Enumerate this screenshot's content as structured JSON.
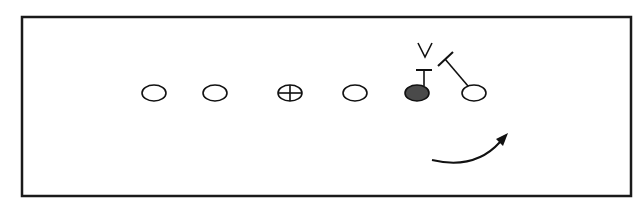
{
  "diagram": {
    "type": "football-play-diagram",
    "frame": {
      "x": 22,
      "y": 17,
      "width": 609,
      "height": 179,
      "stroke": "#1a1a1a"
    },
    "players": [
      {
        "id": "lineman-1",
        "shape": "open-ellipse",
        "cx": 154,
        "cy": 93
      },
      {
        "id": "lineman-2",
        "shape": "open-ellipse",
        "cx": 215,
        "cy": 93
      },
      {
        "id": "center",
        "shape": "crossed-ellipse",
        "cx": 290,
        "cy": 93
      },
      {
        "id": "lineman-4",
        "shape": "open-ellipse",
        "cx": 355,
        "cy": 93
      },
      {
        "id": "highlighted-player",
        "shape": "filled-ellipse",
        "cx": 417,
        "cy": 93,
        "fill": "#4a4a4a"
      },
      {
        "id": "end",
        "shape": "open-ellipse",
        "cx": 474,
        "cy": 93
      }
    ],
    "defender_mark": {
      "symbol": "V",
      "x": 425,
      "y": 52
    },
    "blocks": [
      {
        "from": "highlighted-player",
        "type": "vertical-block",
        "x": 424,
        "y1": 88,
        "y2": 70,
        "bar_half": 7
      },
      {
        "from": "end",
        "type": "diagonal-block",
        "x1": 468,
        "y1": 88,
        "x2": 445,
        "y2": 60
      }
    ],
    "motion_arrow": {
      "start": [
        432,
        161
      ],
      "control": [
        480,
        170
      ],
      "end": [
        507,
        134
      ],
      "color": "#111111"
    }
  }
}
